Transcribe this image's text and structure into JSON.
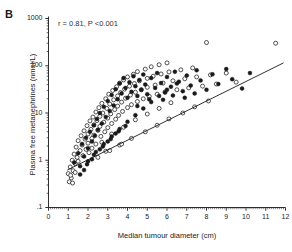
{
  "panel": {
    "label": "B"
  },
  "annotation": {
    "text": "r = 0.81, P <0.001"
  },
  "chart_data": {
    "type": "scatter",
    "title": "",
    "subtitle": "",
    "xlabel": "Median tumour diameter (cm)",
    "ylabel": "Plasma free metanephrines (nmol/L)",
    "annotations": [
      "r = 0.81, P <0.001"
    ],
    "panel_label": "B",
    "grid": false,
    "legend_position": "none",
    "xscale": "linear",
    "yscale": "log",
    "xlim": [
      0,
      12
    ],
    "ylim": [
      0.1,
      1000
    ],
    "xticks": [
      0,
      1,
      2,
      3,
      4,
      5,
      6,
      7,
      8,
      9,
      10,
      11,
      12
    ],
    "xtick_labels": [
      "0",
      "1",
      "2",
      "3",
      "4",
      "5",
      "6",
      "7",
      "8",
      "9",
      "10",
      "11",
      "12"
    ],
    "yticks": [
      0.1,
      1,
      10,
      100,
      1000
    ],
    "ytick_labels": [
      ".1",
      "1",
      "10",
      "100",
      "1000"
    ],
    "correlation_r": 0.81,
    "p_value": "<0.001",
    "marker_colors": {
      "open": "#ffffff",
      "open_edge": "#1a1a1a",
      "filled": "#1a1a1a",
      "line": "#1a1a1a"
    },
    "regression_line": {
      "x": [
        0.95,
        11.9
      ],
      "y": [
        0.62,
        115.0
      ]
    },
    "series": [
      {
        "name": "open-circles",
        "marker": "open-circle",
        "points": [
          [
            1.0,
            0.52
          ],
          [
            1.1,
            0.72
          ],
          [
            1.15,
            0.42
          ],
          [
            1.2,
            1.0
          ],
          [
            1.25,
            0.6
          ],
          [
            1.3,
            1.35
          ],
          [
            1.35,
            0.85
          ],
          [
            1.4,
            1.9
          ],
          [
            1.45,
            1.15
          ],
          [
            1.5,
            2.6
          ],
          [
            1.5,
            0.95
          ],
          [
            1.6,
            1.6
          ],
          [
            1.65,
            3.3
          ],
          [
            1.7,
            2.1
          ],
          [
            1.75,
            1.25
          ],
          [
            1.8,
            4.2
          ],
          [
            1.85,
            2.8
          ],
          [
            1.9,
            1.7
          ],
          [
            1.95,
            5.4
          ],
          [
            2.0,
            3.6
          ],
          [
            2.0,
            2.3
          ],
          [
            2.05,
            1.45
          ],
          [
            2.1,
            6.8
          ],
          [
            2.15,
            4.5
          ],
          [
            2.2,
            2.9
          ],
          [
            2.25,
            8.2
          ],
          [
            2.3,
            5.6
          ],
          [
            2.3,
            3.4
          ],
          [
            2.4,
            2.2
          ],
          [
            2.4,
            10.5
          ],
          [
            2.45,
            6.9
          ],
          [
            2.5,
            4.3
          ],
          [
            2.55,
            13.0
          ],
          [
            2.6,
            8.5
          ],
          [
            2.6,
            5.2
          ],
          [
            2.65,
            3.2
          ],
          [
            2.7,
            16.0
          ],
          [
            2.75,
            10.0
          ],
          [
            2.8,
            6.4
          ],
          [
            2.85,
            4.0
          ],
          [
            2.9,
            20.0
          ],
          [
            2.95,
            12.5
          ],
          [
            3.0,
            7.8
          ],
          [
            3.0,
            4.9
          ],
          [
            3.05,
            25.0
          ],
          [
            3.1,
            15.5
          ],
          [
            3.15,
            9.6
          ],
          [
            3.2,
            6.0
          ],
          [
            3.25,
            30.0
          ],
          [
            3.3,
            19.0
          ],
          [
            3.35,
            11.8
          ],
          [
            3.4,
            7.4
          ],
          [
            3.45,
            36.0
          ],
          [
            3.5,
            23.0
          ],
          [
            3.5,
            14.0
          ],
          [
            3.55,
            8.9
          ],
          [
            3.6,
            43.0
          ],
          [
            3.65,
            27.0
          ],
          [
            3.7,
            17.0
          ],
          [
            3.75,
            10.8
          ],
          [
            3.8,
            50.0
          ],
          [
            3.85,
            32.0
          ],
          [
            3.9,
            20.5
          ],
          [
            4.0,
            13.0
          ],
          [
            4.0,
            58.0
          ],
          [
            4.1,
            37.0
          ],
          [
            4.15,
            24.0
          ],
          [
            4.2,
            15.0
          ],
          [
            4.3,
            66.0
          ],
          [
            4.35,
            42.0
          ],
          [
            4.4,
            27.5
          ],
          [
            4.5,
            17.5
          ],
          [
            4.5,
            75.0
          ],
          [
            4.6,
            48.0
          ],
          [
            4.7,
            31.0
          ],
          [
            4.8,
            20.0
          ],
          [
            4.9,
            85.0
          ],
          [
            5.0,
            54.0
          ],
          [
            5.0,
            35.0
          ],
          [
            5.1,
            22.5
          ],
          [
            5.2,
            95.0
          ],
          [
            5.3,
            60.0
          ],
          [
            5.4,
            39.0
          ],
          [
            5.5,
            25.0
          ],
          [
            5.6,
            105.0
          ],
          [
            5.7,
            67.0
          ],
          [
            5.8,
            43.0
          ],
          [
            5.9,
            28.0
          ],
          [
            6.0,
            115.0
          ],
          [
            6.1,
            74.0
          ],
          [
            6.3,
            48.0
          ],
          [
            6.5,
            31.0
          ],
          [
            6.7,
            82.0
          ],
          [
            6.9,
            53.0
          ],
          [
            7.1,
            34.0
          ],
          [
            7.3,
            90.0
          ],
          [
            7.5,
            58.0
          ],
          [
            7.8,
            37.0
          ],
          [
            8.0,
            310.0
          ],
          [
            8.2,
            64.0
          ],
          [
            8.5,
            41.0
          ],
          [
            9.0,
            70.0
          ],
          [
            9.5,
            45.0
          ],
          [
            11.5,
            300.0
          ],
          [
            1.05,
            0.35
          ],
          [
            1.12,
            0.48
          ],
          [
            1.22,
            0.33
          ],
          [
            1.35,
            0.55
          ],
          [
            2.2,
            1.8
          ],
          [
            2.7,
            2.4
          ],
          [
            3.2,
            3.6
          ],
          [
            3.8,
            5.0
          ],
          [
            4.4,
            7.2
          ],
          [
            5.0,
            9.5
          ],
          [
            5.6,
            12.5
          ],
          [
            6.2,
            16.5
          ],
          [
            2.9,
            1.55
          ],
          [
            3.6,
            2.1
          ],
          [
            4.2,
            2.9
          ],
          [
            4.9,
            4.0
          ],
          [
            5.5,
            5.5
          ],
          [
            6.1,
            7.5
          ],
          [
            6.8,
            10.0
          ],
          [
            7.4,
            13.5
          ],
          [
            8.1,
            18.0
          ],
          [
            2.5,
            1.15
          ],
          [
            3.1,
            1.6
          ],
          [
            3.7,
            2.2
          ]
        ]
      },
      {
        "name": "filled-circles",
        "marker": "filled-circle",
        "points": [
          [
            1.3,
            0.9
          ],
          [
            1.5,
            1.4
          ],
          [
            1.6,
            0.75
          ],
          [
            1.7,
            2.2
          ],
          [
            1.8,
            1.2
          ],
          [
            1.9,
            3.0
          ],
          [
            2.0,
            1.8
          ],
          [
            2.1,
            4.0
          ],
          [
            2.2,
            2.5
          ],
          [
            2.3,
            5.5
          ],
          [
            2.35,
            3.3
          ],
          [
            2.45,
            7.5
          ],
          [
            2.5,
            4.4
          ],
          [
            2.6,
            10.0
          ],
          [
            2.7,
            6.0
          ],
          [
            2.8,
            13.5
          ],
          [
            2.9,
            8.2
          ],
          [
            3.0,
            18.0
          ],
          [
            3.1,
            11.0
          ],
          [
            3.2,
            24.0
          ],
          [
            3.3,
            14.5
          ],
          [
            3.4,
            32.0
          ],
          [
            3.5,
            19.5
          ],
          [
            3.6,
            42.0
          ],
          [
            3.7,
            26.0
          ],
          [
            3.8,
            55.0
          ],
          [
            3.9,
            34.0
          ],
          [
            4.0,
            21.0
          ],
          [
            4.1,
            45.0
          ],
          [
            4.2,
            28.0
          ],
          [
            4.3,
            60.0
          ],
          [
            4.4,
            37.0
          ],
          [
            4.5,
            23.0
          ],
          [
            4.6,
            50.0
          ],
          [
            4.7,
            31.0
          ],
          [
            4.8,
            65.0
          ],
          [
            4.9,
            40.0
          ],
          [
            5.0,
            25.0
          ],
          [
            5.2,
            55.0
          ],
          [
            5.4,
            34.0
          ],
          [
            5.5,
            70.0
          ],
          [
            5.7,
            43.0
          ],
          [
            5.9,
            27.0
          ],
          [
            6.0,
            58.0
          ],
          [
            6.2,
            36.0
          ],
          [
            6.4,
            75.0
          ],
          [
            6.6,
            46.0
          ],
          [
            6.8,
            29.0
          ],
          [
            7.0,
            62.0
          ],
          [
            7.2,
            38.0
          ],
          [
            7.5,
            80.0
          ],
          [
            7.7,
            49.0
          ],
          [
            8.0,
            31.0
          ],
          [
            8.3,
            66.0
          ],
          [
            8.6,
            41.0
          ],
          [
            9.0,
            85.0
          ],
          [
            9.3,
            52.0
          ],
          [
            9.8,
            33.0
          ],
          [
            10.2,
            70.0
          ],
          [
            2.0,
            0.95
          ],
          [
            2.4,
            1.5
          ],
          [
            2.8,
            2.2
          ],
          [
            3.2,
            3.2
          ],
          [
            3.6,
            4.6
          ],
          [
            4.0,
            6.5
          ],
          [
            4.4,
            9.0
          ],
          [
            4.8,
            12.5
          ],
          [
            5.2,
            17.0
          ],
          [
            5.6,
            23.0
          ],
          [
            6.0,
            31.0
          ],
          [
            6.5,
            42.0
          ],
          [
            1.8,
            0.62
          ],
          [
            2.2,
            1.05
          ],
          [
            2.6,
            1.7
          ],
          [
            3.0,
            2.5
          ],
          [
            3.4,
            3.7
          ],
          [
            3.9,
            5.3
          ],
          [
            1.6,
            0.5
          ],
          [
            1.95,
            0.82
          ],
          [
            4.5,
            14.0
          ],
          [
            5.1,
            19.5
          ],
          [
            5.8,
            19.0
          ],
          [
            6.3,
            23.5
          ],
          [
            6.9,
            21.0
          ],
          [
            7.4,
            26.0
          ],
          [
            2.3,
            1.3
          ],
          [
            2.75,
            1.95
          ],
          [
            3.15,
            2.8
          ],
          [
            3.55,
            4.1
          ]
        ]
      }
    ]
  }
}
